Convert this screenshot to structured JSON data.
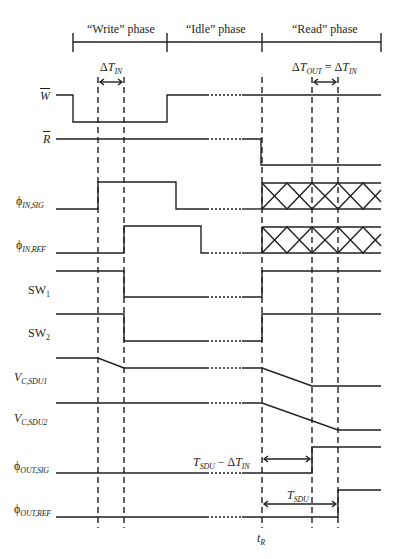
{
  "diagram": {
    "type": "timing-diagram",
    "phases": [
      {
        "label": "“Write” phase",
        "x_start": 73,
        "x_end": 167
      },
      {
        "label": "“Idle” phase",
        "x_start": 167,
        "x_end": 262
      },
      {
        "label": "“Read” phase",
        "x_start": 262,
        "x_end": 381
      }
    ],
    "annotations": {
      "delta_t_in": {
        "delta": "Δ",
        "main": "T",
        "sub": "IN"
      },
      "delta_t_out": {
        "delta": "Δ",
        "main": "T",
        "sub": "OUT",
        "eq": " = ",
        "delta2": "Δ",
        "main2": "T",
        "sub2": "IN"
      },
      "tsdu_minus": {
        "main": "T",
        "sub": "SDU",
        "minus": " − ",
        "delta": "Δ",
        "main2": "T",
        "sub2": "IN"
      },
      "tsdu": {
        "main": "T",
        "sub": "SDU"
      },
      "t_r": {
        "main": "t",
        "sub": "R"
      }
    },
    "signals": [
      {
        "id": "W_bar",
        "label": "W"
      },
      {
        "id": "R_bar",
        "label": "R"
      },
      {
        "id": "phi_in_sig",
        "label": "ϕ",
        "sub": "IN,SIG"
      },
      {
        "id": "phi_in_ref",
        "label": "ϕ",
        "sub": "IN,REF"
      },
      {
        "id": "sw1",
        "label": "SW",
        "sub": "1"
      },
      {
        "id": "sw2",
        "label": "SW",
        "sub": "2"
      },
      {
        "id": "vc_sdu1",
        "label": "V",
        "sub": "C,SDU1"
      },
      {
        "id": "vc_sdu2",
        "label": "V",
        "sub": "C,SDU2"
      },
      {
        "id": "phi_out_sig",
        "label": "ϕ",
        "sub": "OUT,SIG"
      },
      {
        "id": "phi_out_ref",
        "label": "ϕ",
        "sub": "OUT,REF"
      }
    ],
    "colors": {
      "line": "#231f20",
      "background": "#ffffff"
    }
  }
}
